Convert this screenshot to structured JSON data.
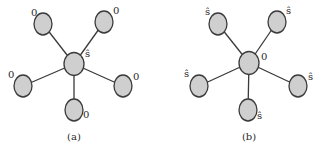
{
  "figure": {
    "panels": [
      {
        "caption": "(a)",
        "center_label": "ŝ",
        "leaf_labels": [
          "0",
          "0",
          "0",
          "0",
          "0"
        ]
      },
      {
        "caption": "(b)",
        "center_label": "0",
        "leaf_labels": [
          "ŝ",
          "ŝ",
          "ŝ",
          "ŝ",
          "ŝ"
        ]
      }
    ],
    "node_fill": "#cfcfcf",
    "edge_color": "#3a3a3a"
  }
}
